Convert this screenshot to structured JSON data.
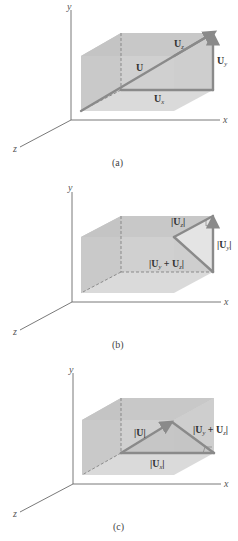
{
  "figure": {
    "panels": [
      {
        "id": "a",
        "caption": "(a)",
        "axes": {
          "x": "x",
          "y": "y",
          "z": "z"
        },
        "labels": {
          "U": "U",
          "Ux": "U",
          "Ux_sub": "x",
          "Uy": "U",
          "Uy_sub": "y",
          "Uz": "U",
          "Uz_sub": "z"
        }
      },
      {
        "id": "b",
        "caption": "(b)",
        "axes": {
          "x": "x",
          "y": "y",
          "z": "z"
        },
        "labels": {
          "Uz_pre": "|U",
          "Uz_sub": "z",
          "Uz_post": "|",
          "Uy_pre": "|U",
          "Uy_sub": "y",
          "Uy_post": "|",
          "Uyz_a": "|U",
          "Uyz_sub1": "y",
          "Uyz_mid": " + U",
          "Uyz_sub2": "z",
          "Uyz_post": "|"
        }
      },
      {
        "id": "c",
        "caption": "(c)",
        "axes": {
          "x": "x",
          "y": "y",
          "z": "z"
        },
        "labels": {
          "U_mag": "|U|",
          "Ux_pre": "|U",
          "Ux_sub": "x",
          "Ux_post": "|",
          "Uyz_a": "|U",
          "Uyz_sub1": "y",
          "Uyz_mid": " + U",
          "Uyz_sub2": "z",
          "Uyz_post": "|"
        }
      }
    ],
    "colors": {
      "box_left": "#bcbcbc",
      "box_top": "#c6c6c6",
      "box_front": "#cdcdcd",
      "box_back": "#d6d6d6",
      "vector": "#8a8a8a",
      "triangle_fill": "#e4e4e4"
    }
  }
}
